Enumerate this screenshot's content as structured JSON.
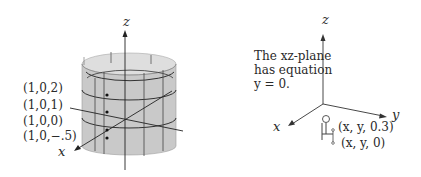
{
  "left_figure": {
    "axis_labels": {
      "z": "z",
      "x": "x"
    },
    "point_labels": [
      "(1,0,2)",
      "(1,0,1)",
      "(1,0,0)",
      "(1,0,−.5)"
    ],
    "surface": "cylinder",
    "surface_color": "#c8c8c8"
  },
  "right_figure": {
    "axis_labels": {
      "z": "z",
      "x": "x",
      "y": "y"
    },
    "note_line1": "The xz-plane",
    "note_line2": "has equation",
    "note_line3": "y = 0.",
    "point_labels": [
      "(x, y, 0.3)",
      "(x, y, 0)"
    ]
  }
}
